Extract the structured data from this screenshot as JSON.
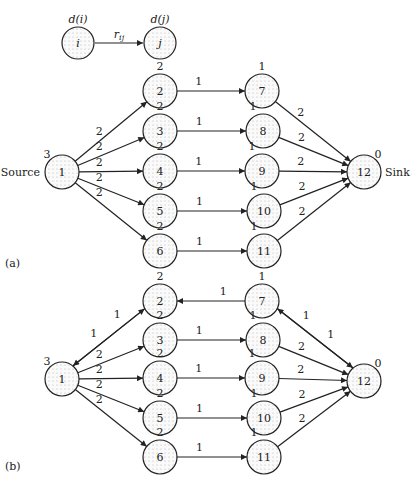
{
  "legend": {
    "node_i_label": "i",
    "node_j_label": "j",
    "dist_i": "d(i)",
    "dist_j": "d(j)",
    "edge_label": "r_ij"
  },
  "panels": [
    {
      "caption": "(a)",
      "source_label": "Source",
      "sink_label": "Sink",
      "nodes": [
        {
          "id": "1",
          "d": "3",
          "x": 62,
          "y": 172
        },
        {
          "id": "2",
          "d": "2",
          "x": 160,
          "y": 91
        },
        {
          "id": "3",
          "d": "2",
          "x": 160,
          "y": 131
        },
        {
          "id": "4",
          "d": "2",
          "x": 160,
          "y": 171
        },
        {
          "id": "5",
          "d": "2",
          "x": 160,
          "y": 211
        },
        {
          "id": "6",
          "d": "2",
          "x": 160,
          "y": 251
        },
        {
          "id": "7",
          "d": "1",
          "x": 262,
          "y": 91
        },
        {
          "id": "8",
          "d": "1",
          "x": 263,
          "y": 131
        },
        {
          "id": "9",
          "d": "1",
          "x": 262,
          "y": 171
        },
        {
          "id": "10",
          "d": "1",
          "x": 264,
          "y": 211
        },
        {
          "id": "11",
          "d": "1",
          "x": 264,
          "y": 251
        },
        {
          "id": "12",
          "d": "0",
          "x": 364,
          "y": 172
        }
      ],
      "edges": [
        {
          "from": "1",
          "to": "2",
          "r": "2"
        },
        {
          "from": "1",
          "to": "3",
          "r": "2"
        },
        {
          "from": "1",
          "to": "4",
          "r": "2"
        },
        {
          "from": "1",
          "to": "5",
          "r": "2"
        },
        {
          "from": "1",
          "to": "6",
          "r": "2"
        },
        {
          "from": "2",
          "to": "7",
          "r": "1"
        },
        {
          "from": "3",
          "to": "8",
          "r": "1"
        },
        {
          "from": "4",
          "to": "9",
          "r": "1"
        },
        {
          "from": "5",
          "to": "10",
          "r": "1"
        },
        {
          "from": "6",
          "to": "11",
          "r": "1"
        },
        {
          "from": "7",
          "to": "12",
          "r": "2"
        },
        {
          "from": "8",
          "to": "12",
          "r": "2"
        },
        {
          "from": "9",
          "to": "12",
          "r": "2"
        },
        {
          "from": "10",
          "to": "12",
          "r": "2"
        },
        {
          "from": "11",
          "to": "12",
          "r": "2"
        }
      ]
    },
    {
      "caption": "(b)",
      "nodes": [
        {
          "id": "1",
          "d": "3",
          "x": 62,
          "y": 379
        },
        {
          "id": "2",
          "d": "2",
          "x": 160,
          "y": 301
        },
        {
          "id": "3",
          "d": "2",
          "x": 160,
          "y": 340
        },
        {
          "id": "4",
          "d": "2",
          "x": 160,
          "y": 378
        },
        {
          "id": "5",
          "d": "2",
          "x": 160,
          "y": 418
        },
        {
          "id": "6",
          "d": "2",
          "x": 160,
          "y": 457
        },
        {
          "id": "7",
          "d": "1",
          "x": 262,
          "y": 301
        },
        {
          "id": "8",
          "d": "1",
          "x": 263,
          "y": 340
        },
        {
          "id": "9",
          "d": "1",
          "x": 262,
          "y": 378
        },
        {
          "id": "10",
          "d": "1",
          "x": 264,
          "y": 418
        },
        {
          "id": "11",
          "d": "1",
          "x": 264,
          "y": 457
        },
        {
          "id": "12",
          "d": "0",
          "x": 364,
          "y": 381
        }
      ],
      "edges": [
        {
          "from": "1",
          "to": "2",
          "r": "1"
        },
        {
          "from": "2",
          "to": "1",
          "r": "1"
        },
        {
          "from": "1",
          "to": "3",
          "r": "2"
        },
        {
          "from": "1",
          "to": "4",
          "r": "2"
        },
        {
          "from": "1",
          "to": "5",
          "r": "2"
        },
        {
          "from": "1",
          "to": "6",
          "r": "2"
        },
        {
          "from": "7",
          "to": "2",
          "r": "1"
        },
        {
          "from": "3",
          "to": "8",
          "r": "1"
        },
        {
          "from": "4",
          "to": "9",
          "r": "1"
        },
        {
          "from": "5",
          "to": "10",
          "r": "1"
        },
        {
          "from": "6",
          "to": "11",
          "r": "1"
        },
        {
          "from": "7",
          "to": "12",
          "r": "1"
        },
        {
          "from": "12",
          "to": "7",
          "r": "1"
        },
        {
          "from": "8",
          "to": "12",
          "r": "2"
        },
        {
          "from": "9",
          "to": "12",
          "r": "2"
        },
        {
          "from": "10",
          "to": "12",
          "r": "2"
        },
        {
          "from": "11",
          "to": "12",
          "r": "2"
        }
      ]
    }
  ]
}
